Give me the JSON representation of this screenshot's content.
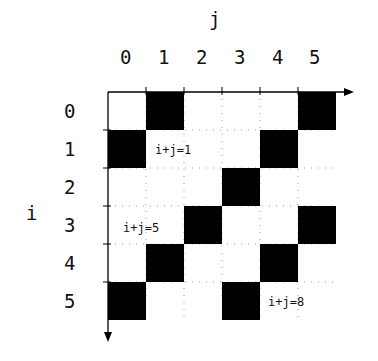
{
  "axes": {
    "col_axis_label": "j",
    "row_axis_label": "i",
    "col_labels": [
      "0",
      "1",
      "2",
      "3",
      "4",
      "5"
    ],
    "row_labels": [
      "0",
      "1",
      "2",
      "3",
      "4",
      "5"
    ]
  },
  "filled_cells": [
    [
      0,
      1
    ],
    [
      0,
      5
    ],
    [
      1,
      0
    ],
    [
      1,
      4
    ],
    [
      2,
      3
    ],
    [
      3,
      2
    ],
    [
      3,
      5
    ],
    [
      4,
      1
    ],
    [
      4,
      4
    ],
    [
      5,
      0
    ],
    [
      5,
      3
    ]
  ],
  "annotations": [
    "i+j=1",
    "i+j=5",
    "i+j=8"
  ],
  "colors": {
    "fill": "#000000",
    "grid": "#999999"
  }
}
